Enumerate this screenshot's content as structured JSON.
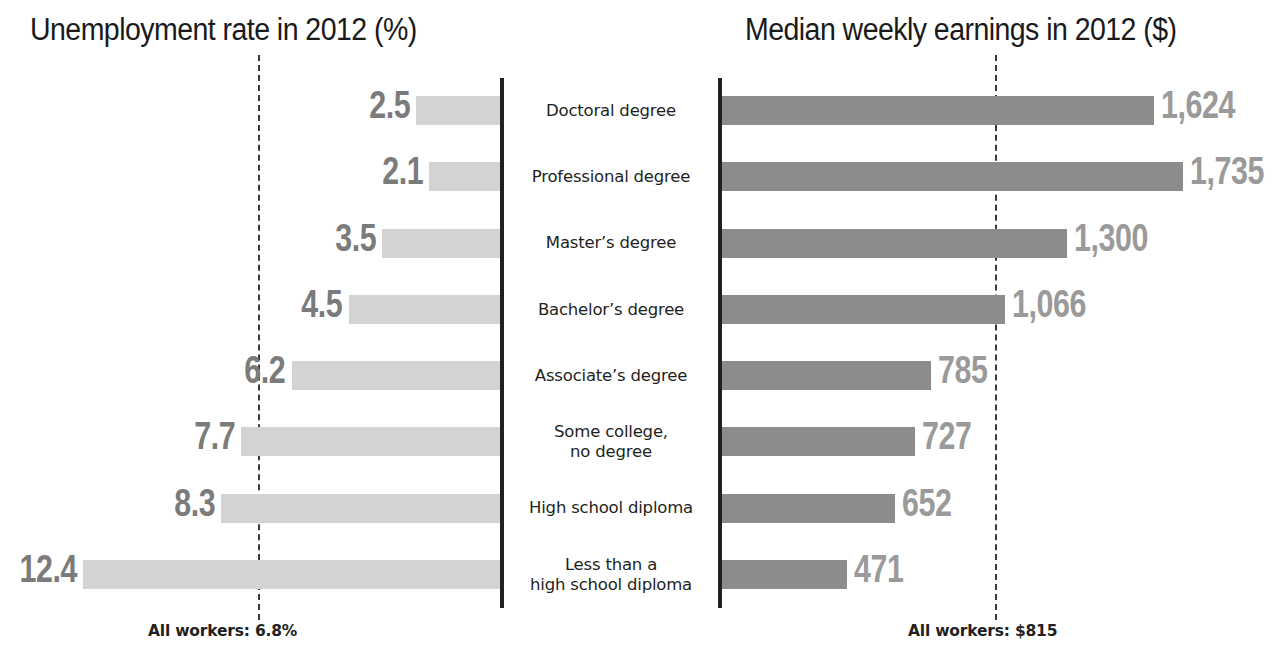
{
  "chart_data": {
    "type": "bar",
    "titles": {
      "left": "Unemployment rate in 2012 (%)",
      "right": "Median weekly earnings in 2012 ($)"
    },
    "categories": [
      "Doctoral degree",
      "Professional degree",
      "Master’s degree",
      "Bachelor’s degree",
      "Associate’s degree",
      "Some college,\nno degree",
      "High school diploma",
      "Less than a\nhigh school diploma"
    ],
    "series": [
      {
        "name": "Unemployment rate in 2012 (%)",
        "orientation": "left",
        "unit": "%",
        "color": "#d3d3d3",
        "values": [
          2.5,
          2.1,
          3.5,
          4.5,
          6.2,
          7.7,
          8.3,
          12.4
        ],
        "labels": [
          "2.5",
          "2.1",
          "3.5",
          "4.5",
          "6.2",
          "7.7",
          "8.3",
          "12.4"
        ],
        "max": 12.4,
        "reference": {
          "value": 6.8,
          "label": "All workers: 6.8%"
        }
      },
      {
        "name": "Median weekly earnings in 2012 ($)",
        "orientation": "right",
        "unit": "$",
        "color": "#8c8c8c",
        "values": [
          1624,
          1735,
          1300,
          1066,
          785,
          727,
          652,
          471
        ],
        "labels": [
          "1,624",
          "1,735",
          "1,300",
          "1,066",
          "785",
          "727",
          "652",
          "471"
        ],
        "max": 1735,
        "reference": {
          "value": 815,
          "label": "All workers: $815"
        }
      }
    ],
    "xlabel": "",
    "ylabel": "",
    "grid": false,
    "legend": "none",
    "annotations": [
      "All workers: 6.8%",
      "All workers: $815"
    ]
  },
  "rows": [
    {
      "category": "Doctoral degree",
      "line1": "Doctoral degree",
      "line2": "",
      "left_label": "2.5",
      "left_value": 2.5,
      "right_label": "1,624",
      "right_value": 1624
    },
    {
      "category": "Professional degree",
      "line1": "Professional degree",
      "line2": "",
      "left_label": "2.1",
      "left_value": 2.1,
      "right_label": "1,735",
      "right_value": 1735
    },
    {
      "category": "Master’s degree",
      "line1": "Master’s degree",
      "line2": "",
      "left_label": "3.5",
      "left_value": 3.5,
      "right_label": "1,300",
      "right_value": 1300
    },
    {
      "category": "Bachelor’s degree",
      "line1": "Bachelor’s degree",
      "line2": "",
      "left_label": "4.5",
      "left_value": 4.5,
      "right_label": "1,066",
      "right_value": 1066
    },
    {
      "category": "Associate’s degree",
      "line1": "Associate’s degree",
      "line2": "",
      "left_label": "6.2",
      "left_value": 6.2,
      "right_label": "785",
      "right_value": 785
    },
    {
      "category": "Some college, no degree",
      "line1": "Some college,",
      "line2": "no degree",
      "left_label": "7.7",
      "left_value": 7.7,
      "right_label": "727",
      "right_value": 727
    },
    {
      "category": "High school diploma",
      "line1": "High school diploma",
      "line2": "",
      "left_label": "8.3",
      "left_value": 8.3,
      "right_label": "652",
      "right_value": 652
    },
    {
      "category": "Less than a high school diploma",
      "line1": "Less than a",
      "line2": "high school diploma",
      "left_label": "12.4",
      "left_value": 12.4,
      "right_label": "471",
      "right_value": 471
    }
  ],
  "footnotes": {
    "left": "All workers: 6.8%",
    "right": "All workers: $815"
  },
  "colors": {
    "bar_left": "#d3d3d3",
    "bar_right": "#8c8c8c",
    "value_left": "#7b7b7b",
    "value_right": "#9a9a9a",
    "axis": "#231f20",
    "refline": "#3a3a3a",
    "text": "#231f20",
    "background": "#ffffff"
  }
}
